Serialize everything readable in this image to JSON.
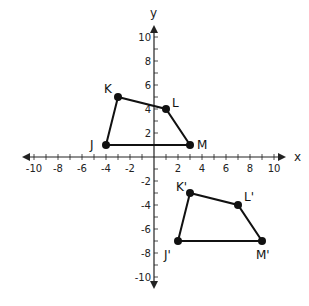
{
  "diagram": {
    "type": "coordinate-plane-translation",
    "axes": {
      "x_label": "x",
      "y_label": "y",
      "x_ticks": [
        -10,
        -8,
        -6,
        -4,
        -2,
        2,
        4,
        6,
        8,
        10
      ],
      "y_ticks": [
        10,
        8,
        6,
        4,
        2,
        -2,
        -4,
        -6,
        -8,
        -10
      ],
      "range": [
        -11,
        11
      ]
    },
    "layout": {
      "origin_px": [
        154,
        157
      ],
      "unit_px": 12
    },
    "colors": {
      "line": "#111111",
      "axis": "#222222",
      "background": "#ffffff"
    },
    "figures": [
      {
        "name": "original",
        "vertices": [
          {
            "label": "J",
            "x": -4,
            "y": 1,
            "label_dx": -16,
            "label_dy": 4
          },
          {
            "label": "K",
            "x": -3,
            "y": 5,
            "label_dx": -14,
            "label_dy": -4
          },
          {
            "label": "L",
            "x": 1,
            "y": 4,
            "label_dx": 6,
            "label_dy": -2
          },
          {
            "label": "M",
            "x": 3,
            "y": 1,
            "label_dx": 7,
            "label_dy": 4
          }
        ]
      },
      {
        "name": "image",
        "vertices": [
          {
            "label": "J'",
            "x": 2,
            "y": -7,
            "label_dx": -14,
            "label_dy": 18
          },
          {
            "label": "K'",
            "x": 3,
            "y": -3,
            "label_dx": -14,
            "label_dy": -2
          },
          {
            "label": "L'",
            "x": 7,
            "y": -4,
            "label_dx": 6,
            "label_dy": -4
          },
          {
            "label": "M'",
            "x": 9,
            "y": -7,
            "label_dx": -6,
            "label_dy": 18
          }
        ]
      }
    ]
  }
}
